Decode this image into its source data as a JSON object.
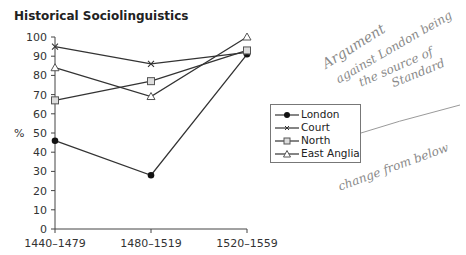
{
  "title": "Historical Sociolinguistics",
  "ylabel": "%",
  "yticks": [
    "0",
    "10",
    "20",
    "30",
    "40",
    "50",
    "60",
    "70",
    "80",
    "90",
    "100"
  ],
  "xticks": [
    "1440–1479",
    "1480–1519",
    "1520–1559"
  ],
  "legend": [
    {
      "name": "London",
      "marker": "filled-circle"
    },
    {
      "name": "Court",
      "marker": "x"
    },
    {
      "name": "North",
      "marker": "square"
    },
    {
      "name": "East Anglia",
      "marker": "triangle"
    }
  ],
  "annotations": {
    "line1": "Argument",
    "line2": "against London being",
    "line3": "the source of",
    "line4": "Standard",
    "note2": "change from below"
  },
  "chart_data": {
    "type": "line",
    "title": "Historical Sociolinguistics",
    "xlabel": "",
    "ylabel": "%",
    "categories": [
      "1440–1479",
      "1480–1519",
      "1520–1559"
    ],
    "ylim": [
      0,
      100
    ],
    "grid": false,
    "legend_position": "right",
    "series": [
      {
        "name": "London",
        "values": [
          46,
          28,
          91
        ]
      },
      {
        "name": "Court",
        "values": [
          95,
          86,
          92
        ]
      },
      {
        "name": "North",
        "values": [
          67,
          77,
          93
        ]
      },
      {
        "name": "East Anglia",
        "values": [
          84,
          69,
          100
        ]
      }
    ]
  }
}
